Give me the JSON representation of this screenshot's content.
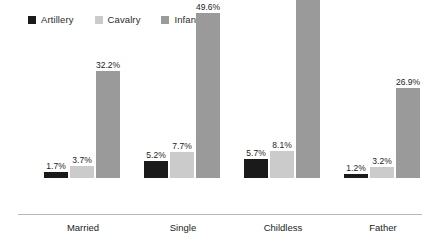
{
  "legend": {
    "items": [
      {
        "label": "Artillery",
        "color": "#1a1a1a",
        "swatch_icon": "square-swatch-icon"
      },
      {
        "label": "Cavalry",
        "color": "#cbcbcb",
        "swatch_icon": "square-swatch-icon"
      },
      {
        "label": "Infantry",
        "color": "#9a9a9a",
        "swatch_icon": "square-swatch-icon"
      }
    ]
  },
  "axis": {
    "baseline_color": "#b7b7b7"
  },
  "chart_data": {
    "type": "bar",
    "title": "",
    "subtitle": "",
    "xlabel": "",
    "ylabel": "",
    "ylim": [
      0,
      60
    ],
    "grid": false,
    "legend_position": "top-left",
    "value_label_suffix": "%",
    "categories": [
      "Married",
      "Single",
      "Childless",
      "Father"
    ],
    "series": [
      {
        "name": "Artillery",
        "color": "#1a1a1a",
        "values": [
          1.7,
          5.2,
          5.7,
          1.2
        ],
        "labels": [
          "1.7%",
          "5.2%",
          "5.7%",
          "1.2%"
        ]
      },
      {
        "name": "Cavalry",
        "color": "#cbcbcb",
        "values": [
          3.7,
          7.7,
          8.1,
          3.2
        ],
        "labels": [
          "3.7%",
          "7.7%",
          "8.1%",
          "3.2%"
        ]
      },
      {
        "name": "Infantry",
        "color": "#9a9a9a",
        "values": [
          32.2,
          49.6,
          54.9,
          26.9
        ],
        "labels": [
          "32.2%",
          "49.6%",
          "54.9%",
          "26.9%"
        ]
      }
    ]
  },
  "groups": [
    {
      "label": "Married",
      "left": 44,
      "bars": [
        {
          "series": "Artillery",
          "label": "1.7%",
          "value": 1.7
        },
        {
          "series": "Cavalry",
          "label": "3.7%",
          "value": 3.7
        },
        {
          "series": "Infantry",
          "label": "32.2%",
          "value": 32.2
        }
      ]
    },
    {
      "label": "Single",
      "left": 144,
      "bars": [
        {
          "series": "Artillery",
          "label": "5.2%",
          "value": 5.2
        },
        {
          "series": "Cavalry",
          "label": "7.7%",
          "value": 7.7
        },
        {
          "series": "Infantry",
          "label": "49.6%",
          "value": 49.6
        }
      ]
    },
    {
      "label": "Childless",
      "left": 244,
      "bars": [
        {
          "series": "Artillery",
          "label": "5.7%",
          "value": 5.7
        },
        {
          "series": "Cavalry",
          "label": "8.1%",
          "value": 8.1
        },
        {
          "series": "Infantry",
          "label": "54.9%",
          "value": 54.9
        }
      ]
    },
    {
      "label": "Father",
      "left": 344,
      "bars": [
        {
          "series": "Artillery",
          "label": "1.2%",
          "value": 1.2
        },
        {
          "series": "Cavalry",
          "label": "3.2%",
          "value": 3.2
        },
        {
          "series": "Infantry",
          "label": "26.9%",
          "value": 26.9
        }
      ]
    }
  ]
}
